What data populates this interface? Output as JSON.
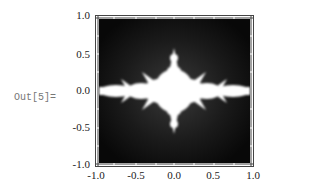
{
  "cell": {
    "output_label": "Out[5]="
  },
  "plot": {
    "type": "density-plot",
    "description": "Julia-set fractal density plot, white set on black background",
    "x_ticks": [
      "-1.0",
      "-0.5",
      "0.0",
      "0.5",
      "1.0"
    ],
    "y_ticks": [
      "1.0",
      "0.5",
      "0.0",
      "-0.5",
      "-1.0"
    ],
    "xlim": [
      -1.0,
      1.0
    ],
    "ylim": [
      -1.0,
      1.0
    ],
    "colors": {
      "background": "#0d0d0d",
      "set": "#ffffff",
      "frame": "#444444"
    }
  }
}
